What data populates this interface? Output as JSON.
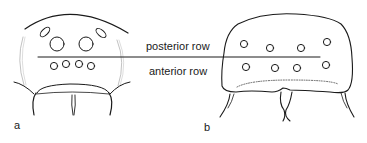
{
  "diagram": {
    "labels": {
      "posterior_row": "posterior row",
      "anterior_row": "anterior row"
    },
    "panels": [
      {
        "id": "a",
        "label": "a",
        "posterior_eyes": 4,
        "anterior_eyes": 4
      },
      {
        "id": "b",
        "label": "b",
        "posterior_eyes": 4,
        "anterior_eyes": 4
      }
    ],
    "colors": {
      "stroke": "#1a1a1a",
      "background": "#ffffff"
    }
  }
}
